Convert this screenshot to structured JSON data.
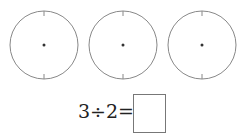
{
  "circles": [
    {
      "cx": 44,
      "cy": 45,
      "r": 34
    },
    {
      "cx": 123,
      "cy": 45,
      "r": 34
    },
    {
      "cx": 202,
      "cy": 45,
      "r": 34
    }
  ],
  "equation": {
    "text": "3÷2=",
    "answer": ""
  },
  "colors": {
    "stroke": "#888888",
    "dot": "#333333"
  }
}
